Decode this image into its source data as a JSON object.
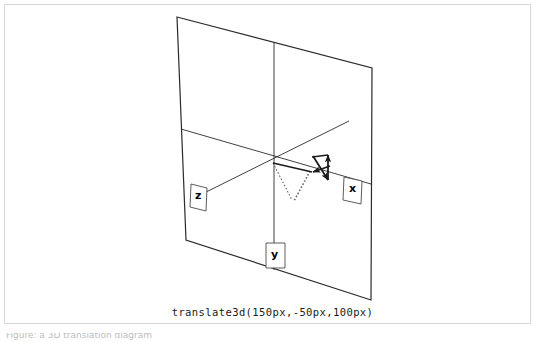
{
  "figure": {
    "caption": "translate3d(150px,-50px,100px)",
    "cutoff_text": "Figure:  a 3D translation diagram",
    "background_color": "#ffffff",
    "stroke_color": "#222222",
    "frame_border_color": "#d8d8d8"
  },
  "axes": [
    {
      "id": "x",
      "label": "x",
      "box_x": 343,
      "box_y": 178,
      "text_x": 352,
      "text_y": 187
    },
    {
      "id": "y",
      "label": "y",
      "box_x": 266,
      "box_y": 244,
      "text_x": 272,
      "text_y": 257
    },
    {
      "id": "z",
      "label": "z",
      "box_x": 190,
      "box_y": 184,
      "text_x": 198,
      "text_y": 194
    }
  ],
  "plane": {
    "name": "reference-plane",
    "corners": "177,17 372,68 371,300 186,240"
  },
  "vectors": [
    {
      "name": "translation-vector-x",
      "direction": "left-down"
    },
    {
      "name": "translation-vector-y",
      "direction": "up"
    },
    {
      "name": "translation-vector-z",
      "direction": "down-right"
    }
  ],
  "guides": [
    {
      "name": "projection-dotted-line",
      "style": "dotted"
    }
  ]
}
